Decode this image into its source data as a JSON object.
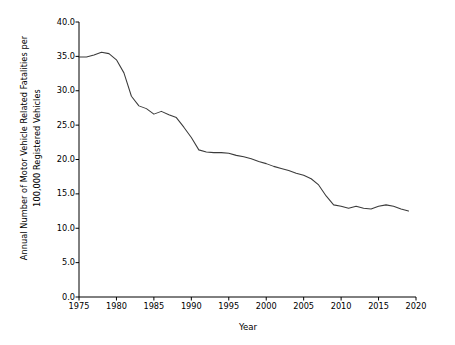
{
  "chart_data": {
    "type": "line",
    "title": "",
    "xlabel": "Year",
    "ylabel": "Annual Number of Motor Vehicle Related Fatalities per 100,000 Registered Vehicles",
    "ylabel_line1": "Annual Number of Motor Vehicle Related Fatalities per",
    "ylabel_line2": "100,000 Registered Vehicles",
    "xlim": [
      1975,
      2020
    ],
    "ylim": [
      0.0,
      40.0
    ],
    "grid": false,
    "legend": "none",
    "line_color": "#3b3b3b",
    "xticks": [
      1975,
      1980,
      1985,
      1990,
      1995,
      2000,
      2005,
      2010,
      2015,
      2020
    ],
    "xtick_labels": [
      "1975",
      "1980",
      "1985",
      "1990",
      "1995",
      "2000",
      "2005",
      "2010",
      "2015",
      "2020"
    ],
    "yticks": [
      0.0,
      5.0,
      10.0,
      15.0,
      20.0,
      25.0,
      30.0,
      35.0,
      40.0
    ],
    "ytick_labels": [
      "0.0",
      "5.0",
      "10.0",
      "15.0",
      "20.0",
      "25.0",
      "30.0",
      "35.0",
      "40.0"
    ],
    "x": [
      1975,
      1976,
      1977,
      1978,
      1979,
      1980,
      1981,
      1982,
      1983,
      1984,
      1985,
      1986,
      1987,
      1988,
      1989,
      1990,
      1991,
      1992,
      1993,
      1994,
      1995,
      1996,
      1997,
      1998,
      1999,
      2000,
      2001,
      2002,
      2003,
      2004,
      2005,
      2006,
      2007,
      2008,
      2009,
      2010,
      2011,
      2012,
      2013,
      2014,
      2015,
      2016,
      2017,
      2018,
      2019
    ],
    "values": [
      34.9,
      34.9,
      35.2,
      35.6,
      35.4,
      34.5,
      32.6,
      29.2,
      27.8,
      27.4,
      26.6,
      27.0,
      26.5,
      26.1,
      24.7,
      23.2,
      21.4,
      21.1,
      21.0,
      21.0,
      20.9,
      20.6,
      20.4,
      20.1,
      19.7,
      19.4,
      19.0,
      18.7,
      18.4,
      18.0,
      17.7,
      17.2,
      16.3,
      14.7,
      13.4,
      13.2,
      12.9,
      13.2,
      12.9,
      12.8,
      13.2,
      13.4,
      13.2,
      12.8,
      12.5
    ],
    "series_name": "Fatality rate per 100,000 registered vehicles"
  }
}
